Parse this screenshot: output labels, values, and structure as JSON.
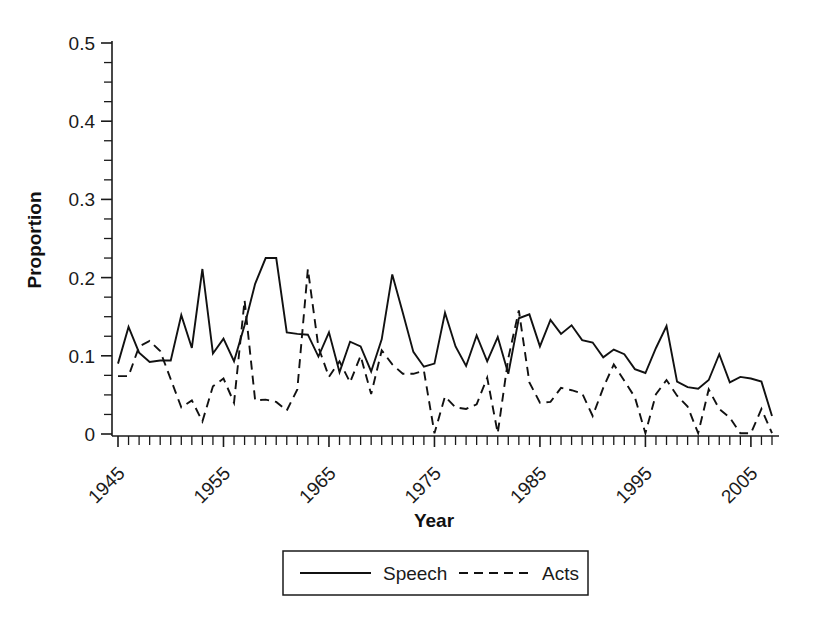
{
  "chart_data": {
    "type": "line",
    "title": "",
    "xlabel": "Year",
    "ylabel": "Proportion",
    "xlim": [
      1945,
      2007
    ],
    "ylim": [
      0,
      0.5
    ],
    "grid": false,
    "legend_position": "bottom",
    "y_ticks": [
      0,
      0.1,
      0.2,
      0.3,
      0.4,
      0.5
    ],
    "y_tick_labels": [
      "0",
      "0.1",
      "0.2",
      "0.3",
      "0.4",
      "0.5"
    ],
    "y_minor_step": 0.025,
    "x_tick_labels": [
      "1945",
      "1955",
      "1965",
      "1975",
      "1985",
      "1995",
      "2005"
    ],
    "x_tick_values": [
      1945,
      1955,
      1965,
      1975,
      1985,
      1995,
      2005
    ],
    "x_minor_step": 1,
    "x": [
      1945,
      1946,
      1947,
      1948,
      1949,
      1950,
      1951,
      1952,
      1953,
      1954,
      1955,
      1956,
      1957,
      1958,
      1959,
      1960,
      1961,
      1962,
      1963,
      1964,
      1965,
      1966,
      1967,
      1968,
      1969,
      1970,
      1971,
      1972,
      1973,
      1974,
      1975,
      1976,
      1977,
      1978,
      1979,
      1980,
      1981,
      1982,
      1983,
      1984,
      1985,
      1986,
      1987,
      1988,
      1989,
      1990,
      1991,
      1992,
      1993,
      1994,
      1995,
      1996,
      1997,
      1998,
      1999,
      2000,
      2001,
      2002,
      2003,
      2004,
      2005,
      2006,
      2007
    ],
    "series": [
      {
        "name": "Speech",
        "style": "solid",
        "values": [
          0.09,
          0.137,
          0.104,
          0.092,
          0.094,
          0.094,
          0.152,
          0.11,
          0.211,
          0.103,
          0.122,
          0.093,
          0.139,
          0.192,
          0.225,
          0.225,
          0.13,
          0.128,
          0.127,
          0.099,
          0.13,
          0.079,
          0.118,
          0.112,
          0.08,
          0.121,
          0.204,
          0.155,
          0.105,
          0.086,
          0.09,
          0.155,
          0.112,
          0.087,
          0.126,
          0.093,
          0.124,
          0.077,
          0.148,
          0.153,
          0.112,
          0.146,
          0.128,
          0.139,
          0.12,
          0.117,
          0.098,
          0.108,
          0.102,
          0.083,
          0.078,
          0.11,
          0.138,
          0.067,
          0.06,
          0.058,
          0.069,
          0.102,
          0.066,
          0.073,
          0.071,
          0.067,
          0.023
        ]
      },
      {
        "name": "Acts",
        "style": "dashed",
        "values": [
          0.074,
          0.074,
          0.112,
          0.119,
          0.106,
          0.07,
          0.034,
          0.043,
          0.016,
          0.061,
          0.071,
          0.04,
          0.171,
          0.043,
          0.044,
          0.041,
          0.03,
          0.057,
          0.211,
          0.111,
          0.073,
          0.093,
          0.066,
          0.1,
          0.051,
          0.107,
          0.089,
          0.077,
          0.077,
          0.081,
          0.001,
          0.048,
          0.034,
          0.032,
          0.038,
          0.072,
          0.001,
          0.097,
          0.158,
          0.066,
          0.04,
          0.041,
          0.059,
          0.056,
          0.052,
          0.023,
          0.059,
          0.089,
          0.068,
          0.047,
          0.001,
          0.051,
          0.069,
          0.049,
          0.035,
          0.001,
          0.057,
          0.032,
          0.021,
          0.001,
          0.001,
          0.032,
          0.001
        ]
      }
    ]
  },
  "legend": {
    "entries": [
      {
        "label": "Speech",
        "style": "solid"
      },
      {
        "label": "Acts",
        "style": "dashed"
      }
    ]
  },
  "axis": {
    "y_title": "Proportion",
    "x_title": "Year"
  }
}
